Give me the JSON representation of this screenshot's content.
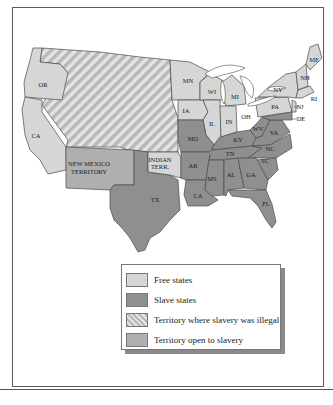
{
  "map": {
    "colors": {
      "free": "#d6d6d6",
      "slave": "#8f8f8f",
      "illegal_territory_a": "#e6e6e6",
      "illegal_territory_b": "#b9b9b9",
      "open_territory": "#afafaf",
      "lakes": "#ffffff",
      "border": "#4a4a4a"
    },
    "labels": {
      "OR": "OR",
      "CA": "CA",
      "MN": "MN",
      "WI": "WI",
      "MI": "MI",
      "IA": "IA",
      "IL": "IL",
      "IN": "IN",
      "OH": "OH",
      "PA": "PA",
      "NY": "NY",
      "ME": "ME",
      "NH": "NH",
      "VT": "VT",
      "MA": "MA",
      "RI": "RI",
      "CT": "CT",
      "NJ": "NJ",
      "DE": "DE",
      "MO": "MO",
      "KY": "KY",
      "WV": "WV",
      "VA": "VA",
      "NC": "NC",
      "TN": "TN",
      "SC": "SC",
      "AR": "AR",
      "MS": "MS",
      "AL": "AL",
      "GA": "GA",
      "LA": "LA",
      "TX": "TX",
      "FL": "FL",
      "MD": "MD",
      "NM_line1": "NEW MEXICO",
      "NM_line2": "TERRITORY",
      "IT_line1": "INDIAN",
      "IT_line2": "TERR."
    }
  },
  "legend": {
    "items": [
      {
        "label": "Free states",
        "swatch": "free"
      },
      {
        "label": "Slave states",
        "swatch": "slave"
      },
      {
        "label": "Territory where slavery was illegal",
        "swatch": "illegal"
      },
      {
        "label": "Territory open to slavery",
        "swatch": "open"
      }
    ]
  }
}
